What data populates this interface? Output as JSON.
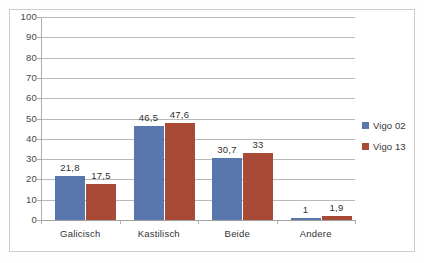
{
  "chart_data": {
    "type": "bar",
    "title": "",
    "subtitle": "",
    "xlabel": "",
    "ylabel": "",
    "categories": [
      "Galicisch",
      "Kastilisch",
      "Beide",
      "Andere"
    ],
    "series": [
      {
        "name": "Vigo 02",
        "color": "#4F6FA8",
        "values": [
          21.8,
          46.5,
          30.7,
          1
        ],
        "labels": [
          "21,8",
          "46,5",
          "30,7",
          "1"
        ]
      },
      {
        "name": "Vigo 13",
        "color": "#A43F2B",
        "values": [
          17.5,
          47.6,
          33,
          1.9
        ],
        "labels": [
          "17,5",
          "47,6",
          "33",
          "1,9"
        ]
      }
    ],
    "ylim": [
      0,
      100
    ],
    "ytick_labels": [
      "100",
      "90",
      "80",
      "70",
      "60",
      "50",
      "40",
      "30",
      "20",
      "10",
      "0"
    ],
    "ytick_values": [
      100,
      90,
      80,
      70,
      60,
      50,
      40,
      30,
      20,
      10,
      0
    ],
    "grid": "horizontal",
    "legend_position": "right",
    "data_labels": true,
    "decimal_separator": ","
  },
  "legend": {
    "entries": [
      {
        "label": "Vigo 02",
        "color": "#4F6FA8"
      },
      {
        "label": "Vigo 13",
        "color": "#A43F2B"
      }
    ]
  }
}
